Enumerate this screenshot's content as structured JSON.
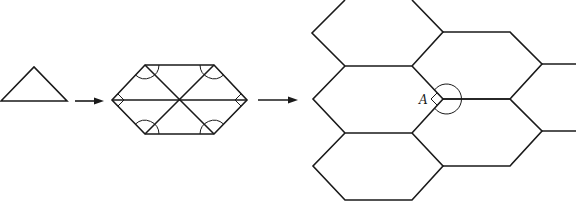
{
  "figure": {
    "steps": [
      {
        "name": "triangle",
        "shape": "triangle"
      },
      {
        "name": "hexagon-from-six-triangles",
        "shape": "hexagon",
        "angle_marks": 6
      },
      {
        "name": "hexagon-tiling",
        "shape": "tessellation",
        "hexagon_count": 7
      }
    ],
    "arrows": 2,
    "vertex_label": "A",
    "colors": {
      "stroke": "#1a1a1a",
      "background": "#ffffff"
    }
  }
}
